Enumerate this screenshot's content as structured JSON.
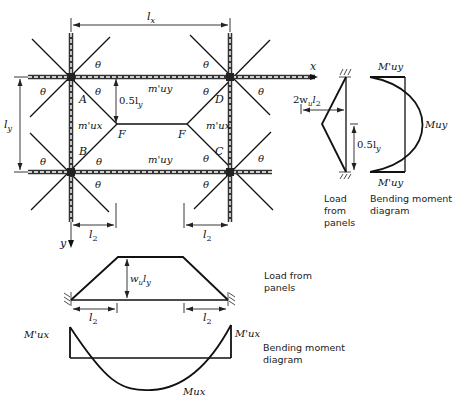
{
  "plan": {
    "span_x_label": "l",
    "span_x_sub": "x",
    "span_y_label": "l",
    "span_y_sub": "y",
    "axis_x": "x",
    "axis_y": "y",
    "angle": "θ",
    "corner_A": "A",
    "corner_B": "B",
    "corner_C": "C",
    "corner_D": "D",
    "point_F_left": "F",
    "point_F_right": "F",
    "m_uy_top": "m'uy",
    "m_uy_bottom": "m'uy",
    "m_ux_left": "m'ux",
    "m_ux_right": "m'ux",
    "half_ly": "0.5l",
    "half_ly_sub": "y",
    "l2_left": "l",
    "l2_right": "l",
    "l2_sub": "2"
  },
  "side_load": {
    "load_label": "2w",
    "load_sub_u": "u",
    "load_l": "l",
    "load_sub_2": "2",
    "half_ly": "0.5l",
    "half_ly_sub": "y",
    "caption_line1": "Load",
    "caption_line2": "from",
    "caption_line3": "panels"
  },
  "side_bmd": {
    "top_label": "M'uy",
    "mid_label": "Muy",
    "bottom_label": "M'uy",
    "caption_line1": "Bending moment",
    "caption_line2": "diagram"
  },
  "bottom_load": {
    "height_label": "w",
    "height_sub_u": "u",
    "height_l": "l",
    "height_sub_y": "y",
    "l2_left": "l",
    "l2_right": "l",
    "l2_sub": "2",
    "caption_line1": "Load from",
    "caption_line2": "panels"
  },
  "bottom_bmd": {
    "left_label": "M'ux",
    "right_label": "M'ux",
    "mid_label": "Mux",
    "caption_line1": "Bending moment",
    "caption_line2": "diagram"
  }
}
